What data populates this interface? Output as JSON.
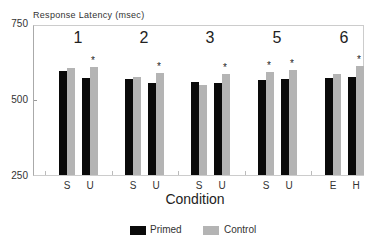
{
  "chart_data": {
    "type": "bar",
    "title": "",
    "ylabel": "Response Latency (msec)",
    "xlabel": "Condition",
    "ylim": [
      250,
      750
    ],
    "yticks": [
      250,
      500,
      750
    ],
    "grid": false,
    "legend_position": "bottom",
    "groups": [
      {
        "label": "1",
        "categories": [
          "S",
          "U"
        ],
        "primed": [
          593,
          571
        ],
        "control": [
          605,
          609
        ],
        "significant": [
          false,
          true
        ]
      },
      {
        "label": "2",
        "categories": [
          "S",
          "U"
        ],
        "primed": [
          568,
          555
        ],
        "control": [
          575,
          587
        ],
        "significant": [
          false,
          true
        ]
      },
      {
        "label": "3",
        "categories": [
          "S",
          "U"
        ],
        "primed": [
          559,
          555
        ],
        "control": [
          548,
          584
        ],
        "significant": [
          false,
          true
        ]
      },
      {
        "label": "5",
        "categories": [
          "S",
          "U"
        ],
        "primed": [
          565,
          568
        ],
        "control": [
          590,
          598
        ],
        "significant": [
          true,
          true
        ]
      },
      {
        "label": "6",
        "categories": [
          "E",
          "H"
        ],
        "primed": [
          571,
          574
        ],
        "control": [
          584,
          611
        ],
        "significant": [
          false,
          true
        ]
      }
    ],
    "categories": [
      "S",
      "U",
      "S",
      "U",
      "S",
      "U",
      "S",
      "U",
      "E",
      "H"
    ],
    "series": [
      {
        "name": "Primed",
        "color": "#0a0a0a",
        "values": [
          593,
          571,
          568,
          555,
          559,
          555,
          565,
          568,
          571,
          574
        ]
      },
      {
        "name": "Control",
        "color": "#b4b4b4",
        "values": [
          605,
          609,
          575,
          587,
          548,
          584,
          590,
          598,
          584,
          611
        ]
      }
    ],
    "annotations": "* marks above control bars indicate significant difference"
  },
  "labels": {
    "y_title": "Response Latency (msec)",
    "x_title": "Condition",
    "yticks": [
      "750",
      "500",
      "250"
    ],
    "star": "*",
    "legend": {
      "primed": "Primed",
      "control": "Control"
    }
  }
}
